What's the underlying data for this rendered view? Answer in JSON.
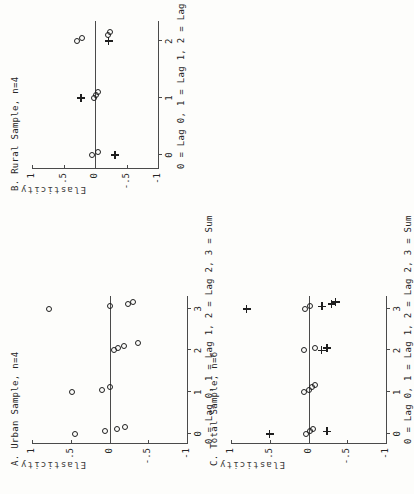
{
  "figure": {
    "orientation": "rotated-90-ccw",
    "panel_count": 3,
    "marker_legend": {
      "circle": "open circle",
      "plus": "plus"
    },
    "axis_color": "#4a4a4a",
    "marker_color": "#1f1f1f"
  },
  "panels": [
    {
      "id": "A",
      "title": "A. Urban Sample, n=4",
      "xlabel": "0 = Lag 0, 1 = Lag 1, 2 = Lag 2, 3 = Sum",
      "ylabel": "Elasticity",
      "xticks": [
        "0",
        "1",
        "2",
        "3"
      ],
      "yticks": [
        "1",
        ".5",
        "0",
        "-.5",
        "-1"
      ]
    },
    {
      "id": "B",
      "title": "B. Rural Sample, n=4",
      "xlabel": "0 = Lag 0, 1 = Lag 1, 2 = Lag",
      "ylabel": "Elasticity",
      "xticks": [
        "0",
        "1",
        "2"
      ],
      "yticks": [
        "1",
        ".5",
        "0",
        "-.5",
        "-1"
      ]
    },
    {
      "id": "C",
      "title": "C. Total Sample, n=6",
      "xlabel": "0 = Lag 0, 1 = Lag 1, 2 = Lag 2, 3 = Sum",
      "ylabel": "Elasticity",
      "xticks": [
        "0",
        "1",
        "2",
        "3"
      ],
      "yticks": [
        "1",
        ".5",
        "0",
        "-.5",
        "-1"
      ]
    }
  ],
  "chart_data": [
    {
      "type": "scatter",
      "panel": "A",
      "title": "A. Urban Sample, n=4",
      "xlabel": "0 = Lag 0, 1 = Lag 1, 2 = Lag 2, 3 = Sum",
      "ylabel": "Elasticity",
      "xlim": [
        -0.25,
        3.3
      ],
      "ylim": [
        -1.0,
        1.0
      ],
      "xticks": [
        0,
        1,
        2,
        3
      ],
      "yticks": [
        1,
        0.5,
        0,
        -0.5,
        -1
      ],
      "ytick_labels": [
        "1",
        ".5",
        "0",
        "-.5",
        "-1"
      ],
      "grid": false,
      "legend": "none",
      "series": [
        {
          "name": "open circle",
          "marker": "circle",
          "points": [
            {
              "x": 0,
              "y": 0.44
            },
            {
              "x": 0,
              "y": 0.06
            },
            {
              "x": 0,
              "y": -0.1
            },
            {
              "x": 0,
              "y": -0.2
            },
            {
              "x": 1,
              "y": 0.48
            },
            {
              "x": 1,
              "y": 0.1
            },
            {
              "x": 1,
              "y": 0.0
            },
            {
              "x": 2,
              "y": -0.06
            },
            {
              "x": 2,
              "y": -0.11
            },
            {
              "x": 2,
              "y": -0.19
            },
            {
              "x": 2,
              "y": -0.37
            },
            {
              "x": 3,
              "y": 0.78
            },
            {
              "x": 3,
              "y": 0.0
            },
            {
              "x": 3,
              "y": -0.24
            },
            {
              "x": 3,
              "y": -0.3
            }
          ]
        }
      ]
    },
    {
      "type": "scatter",
      "panel": "B",
      "title": "B. Rural Sample, n=4",
      "xlabel": "0 = Lag 0, 1 = Lag 1, 2 = Lag",
      "ylabel": "Elasticity",
      "xlim": [
        -0.25,
        2.35
      ],
      "ylim": [
        -1.0,
        1.0
      ],
      "xticks": [
        0,
        1,
        2
      ],
      "yticks": [
        1,
        0.5,
        0,
        -0.5,
        -1
      ],
      "ytick_labels": [
        "1",
        ".5",
        "0",
        "-.5",
        "-1"
      ],
      "grid": false,
      "legend": "none",
      "series": [
        {
          "name": "open circle",
          "marker": "circle",
          "points": [
            {
              "x": 0,
              "y": 0.05
            },
            {
              "x": 0,
              "y": -0.05
            },
            {
              "x": 1,
              "y": 0.02
            },
            {
              "x": 1,
              "y": -0.02
            },
            {
              "x": 1,
              "y": -0.05
            },
            {
              "x": 2,
              "y": 0.28
            },
            {
              "x": 2,
              "y": 0.2
            },
            {
              "x": 2,
              "y": -0.2
            },
            {
              "x": 2,
              "y": -0.24
            }
          ]
        },
        {
          "name": "plus",
          "marker": "plus",
          "points": [
            {
              "x": 0,
              "y": -0.32
            },
            {
              "x": 1,
              "y": 0.22
            },
            {
              "x": 2,
              "y": -0.22
            }
          ]
        }
      ]
    },
    {
      "type": "scatter",
      "panel": "C",
      "title": "C. Total Sample, n=6",
      "xlabel": "0 = Lag 0, 1 = Lag 1, 2 = Lag 2, 3 = Sum",
      "ylabel": "Elasticity",
      "xlim": [
        -0.25,
        3.3
      ],
      "ylim": [
        -1.0,
        1.0
      ],
      "xticks": [
        0,
        1,
        2,
        3
      ],
      "yticks": [
        1,
        0.5,
        0,
        -0.5,
        -1
      ],
      "ytick_labels": [
        "1",
        ".5",
        "0",
        "-.5",
        "-1"
      ],
      "grid": false,
      "legend": "none",
      "series": [
        {
          "name": "open circle",
          "marker": "circle",
          "points": [
            {
              "x": 0,
              "y": 0.03
            },
            {
              "x": 0,
              "y": -0.02
            },
            {
              "x": 0,
              "y": -0.06
            },
            {
              "x": 1,
              "y": 0.06
            },
            {
              "x": 1,
              "y": 0.0
            },
            {
              "x": 1,
              "y": -0.04
            },
            {
              "x": 1,
              "y": -0.08
            },
            {
              "x": 2,
              "y": 0.06
            },
            {
              "x": 2,
              "y": -0.08
            },
            {
              "x": 3,
              "y": 0.04
            },
            {
              "x": 3,
              "y": -0.02
            }
          ]
        },
        {
          "name": "plus",
          "marker": "plus",
          "points": [
            {
              "x": 0,
              "y": 0.5
            },
            {
              "x": 0,
              "y": -0.24
            },
            {
              "x": 2,
              "y": -0.17
            },
            {
              "x": 2,
              "y": -0.24
            },
            {
              "x": 3,
              "y": 0.8
            },
            {
              "x": 3,
              "y": -0.18
            },
            {
              "x": 3,
              "y": -0.3
            },
            {
              "x": 3,
              "y": -0.35
            }
          ]
        }
      ]
    }
  ]
}
